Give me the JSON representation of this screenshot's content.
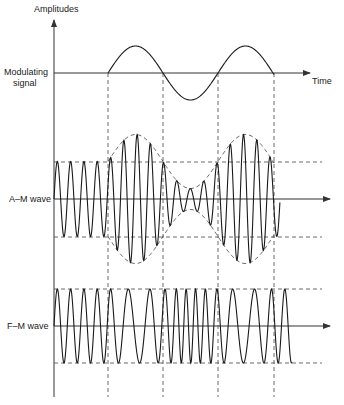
{
  "figure": {
    "y_axis_label": "Amplitudes",
    "x_axis_label": "Time",
    "rows": [
      {
        "id": "modulating",
        "label_line1": "Modulating",
        "label_line2": "signal"
      },
      {
        "id": "am",
        "label": "A–M wave"
      },
      {
        "id": "fm",
        "label": "F–M wave"
      }
    ]
  },
  "chart_data": {
    "type": "line",
    "title": "",
    "xlabel": "Time",
    "ylabel": "Amplitudes",
    "series": [
      {
        "name": "Modulating signal",
        "shape": "sine, starts at x1, ~1.5 cycles, positive half first"
      },
      {
        "name": "A-M wave",
        "shape": "constant-amplitude carrier before x1, then amplitude follows modulating envelope (max at peaks, min at trough)"
      },
      {
        "name": "F-M wave",
        "shape": "constant amplitude; frequency lower during positive half, higher during negative half"
      }
    ],
    "markers": {
      "dashed_vertical_lines": 4,
      "dashed_reference_levels": "unmodulated carrier amplitude"
    },
    "grid": false,
    "legend": "none"
  }
}
